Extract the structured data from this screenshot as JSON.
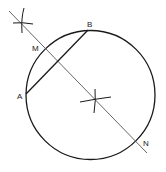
{
  "diagram": {
    "colors": {
      "stroke": "#1a1a1a",
      "bisector": "#555555",
      "background": "#ffffff"
    },
    "circle": {
      "cx": 90.5,
      "cy": 95,
      "r": 64.5
    },
    "chord": {
      "from": "A",
      "to": "B"
    },
    "points": {
      "A": {
        "label": "A",
        "x": 26,
        "y": 94
      },
      "B": {
        "label": "B",
        "x": 88,
        "y": 30
      },
      "M": {
        "label": "M",
        "x": 45,
        "y": 49
      },
      "N": {
        "label": "N",
        "x": 137,
        "y": 140
      }
    },
    "bisector_line": {
      "x1": 9,
      "y1": 11,
      "x2": 147,
      "y2": 153
    },
    "arc_marks": [
      {
        "name": "upper-arc-intersection",
        "x": 22,
        "y": 23
      },
      {
        "name": "lower-arc-intersection",
        "x": 95,
        "y": 100
      }
    ]
  }
}
